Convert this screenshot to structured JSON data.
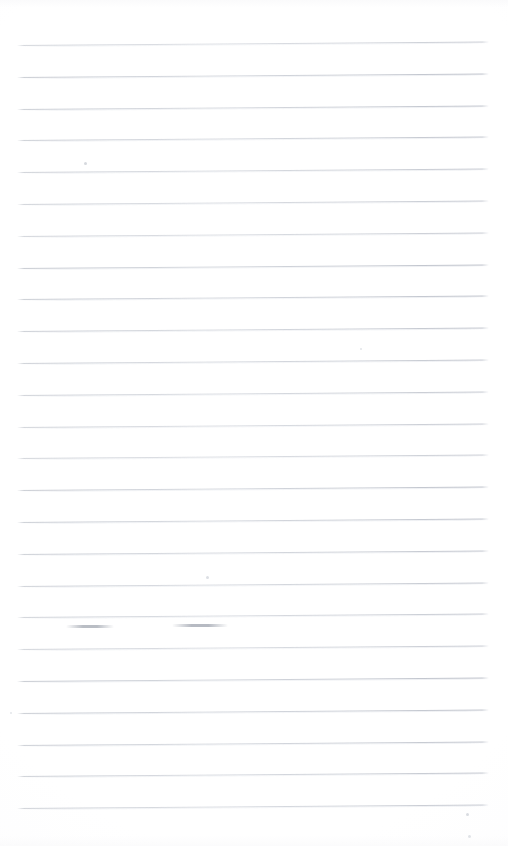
{
  "document": {
    "kind": "scanned-page",
    "title": "Blank ruled notebook page (scan)",
    "page_width": 508,
    "page_height": 846,
    "background_color": "#ffffff",
    "visible_text": ""
  },
  "ruling": {
    "name": "horizontal-ruled-lines",
    "line_color": "#c3c7ce",
    "line_count": 25,
    "first_line_y": 45,
    "line_spacing": 31.8,
    "line_left_x": 17,
    "line_right_x": 489,
    "line_thickness": 1,
    "tilt_degrees": -0.42,
    "lines_y": [
      45,
      76.8,
      108.6,
      140.4,
      172.2,
      204,
      235.8,
      267.6,
      299.4,
      331.2,
      363,
      394.8,
      426.6,
      458.4,
      490.2,
      522,
      553.8,
      585.6,
      617.4,
      649.2,
      681,
      712.8,
      744.6,
      776.4,
      808.2
    ]
  },
  "artifacts": {
    "name": "scan-artifacts",
    "specks": [
      {
        "x": 84,
        "y": 162,
        "size": 3,
        "color": "#d6d9de"
      },
      {
        "x": 206,
        "y": 576,
        "size": 3,
        "color": "#dcdfe4"
      },
      {
        "x": 466,
        "y": 813,
        "size": 3,
        "color": "#d9dce1"
      },
      {
        "x": 468,
        "y": 835,
        "size": 3,
        "color": "#dfe2e6"
      },
      {
        "x": 360,
        "y": 348,
        "size": 2,
        "color": "#e2e5e9"
      },
      {
        "x": 10,
        "y": 712,
        "size": 2,
        "color": "#e3e6ea"
      }
    ],
    "smudges": [
      {
        "x": 66,
        "y": 625,
        "width": 48,
        "color": "#b9bdc4"
      },
      {
        "x": 172,
        "y": 624,
        "width": 56,
        "color": "#b6bac2"
      }
    ]
  }
}
